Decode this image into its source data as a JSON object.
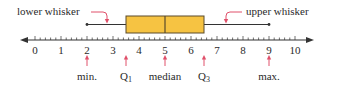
{
  "chart_data": {
    "type": "boxplot",
    "title": "",
    "axis": {
      "min": 0,
      "max": 10,
      "tick_labels": [
        "0",
        "1",
        "2",
        "3",
        "4",
        "5",
        "6",
        "7",
        "8",
        "9",
        "10"
      ],
      "minor_ticks_per_unit": 5,
      "arrows_both_ends": true
    },
    "summary": {
      "min": 2,
      "q1": 3.5,
      "median": 5,
      "q3": 6.5,
      "max": 9
    },
    "annotations": {
      "lower_whisker": "lower whisker",
      "upper_whisker": "upper whisker",
      "min": "min.",
      "q1": "Q",
      "q1_sub": "1",
      "median": "median",
      "q3": "Q",
      "q3_sub": "3",
      "max": "max."
    },
    "colors": {
      "box_fill": "#f6c342",
      "box_stroke": "#5a4a2a",
      "arrow": "#e0506a",
      "axis": "#333333"
    }
  }
}
